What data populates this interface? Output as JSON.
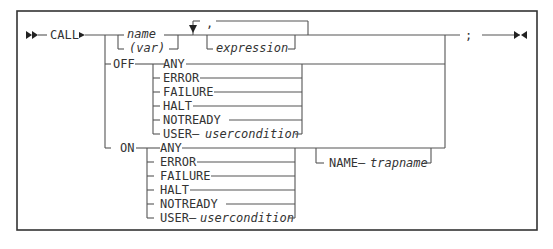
{
  "diagram": {
    "statement": "CALL",
    "terminator": ";",
    "call_target": {
      "options": [
        "name",
        "(var)"
      ],
      "repeat_separator": ",",
      "argument": "expression"
    },
    "off_branch": {
      "keyword": "OFF",
      "conditions": [
        "ANY",
        "ERROR",
        "FAILURE",
        "HALT",
        "NOTREADY",
        "USER—"
      ],
      "user_operand": "usercondition"
    },
    "on_branch": {
      "keyword": "ON",
      "conditions": [
        "ANY",
        "ERROR",
        "FAILURE",
        "HALT",
        "NOTREADY",
        "USER—"
      ],
      "user_operand": "usercondition",
      "name_option": {
        "keyword": "NAME—",
        "operand": "trapname"
      }
    }
  }
}
